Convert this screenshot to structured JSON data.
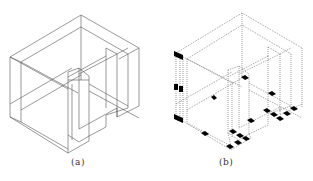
{
  "figure": {
    "panels": [
      {
        "id": "a",
        "caption": "(a)",
        "description": "Isometric wireframe of L-shaped room walls (solid lines)"
      },
      {
        "id": "b",
        "caption": "(b)",
        "description": "Same isometric wireframe drawn with dotted lines, with black square markers at wall junction/sample points"
      }
    ],
    "colors": {
      "background": "#ffffff",
      "line": "#555555",
      "marker": "#000000"
    }
  }
}
